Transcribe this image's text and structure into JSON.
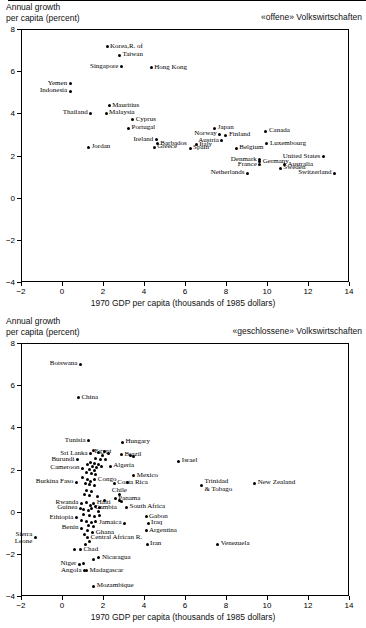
{
  "charts": [
    {
      "id": "open-economies",
      "corner_note": "«offene» Volkswirtschaften",
      "ylabel": "Annual growth\nper capita (percent)",
      "xlabel": "1970 GDP per capita (thousands of 1985 dollars)",
      "chart_data": {
        "type": "scatter",
        "title": "«offene» Volkswirtschaften",
        "xlabel": "1970 GDP per capita (thousands of 1985 dollars)",
        "ylabel": "Annual growth per capita (percent)",
        "xlim": [
          -2,
          14
        ],
        "ylim": [
          -4,
          8
        ],
        "xticks": [
          -2,
          0,
          2,
          4,
          6,
          8,
          10,
          12,
          14
        ],
        "yticks": [
          8,
          6,
          4,
          2,
          0,
          -2,
          -4
        ],
        "grid": false,
        "legend": "none",
        "points": [
          {
            "label": "Korea,R. of",
            "x": 2.15,
            "y": 7.2,
            "pos": "l"
          },
          {
            "label": "Taiwan",
            "x": 2.75,
            "y": 6.8,
            "pos": "l"
          },
          {
            "label": "Singapore",
            "x": 2.85,
            "y": 6.25,
            "pos": "r"
          },
          {
            "label": "Hong Kong",
            "x": 4.3,
            "y": 6.2,
            "pos": "l"
          },
          {
            "label": "Yemen",
            "x": 0.35,
            "y": 5.45,
            "pos": "r"
          },
          {
            "label": "Indonesia",
            "x": 0.35,
            "y": 5.1,
            "pos": "r"
          },
          {
            "label": "Mauritius",
            "x": 2.25,
            "y": 4.4,
            "pos": "l"
          },
          {
            "label": "Thailand",
            "x": 1.35,
            "y": 4.05,
            "pos": "r"
          },
          {
            "label": "Malaysia",
            "x": 2.1,
            "y": 4.05,
            "pos": "l"
          },
          {
            "label": "Cyprus",
            "x": 3.4,
            "y": 3.75,
            "pos": "l"
          },
          {
            "label": "Portugal",
            "x": 3.2,
            "y": 3.35,
            "pos": "l"
          },
          {
            "label": "Japan",
            "x": 7.4,
            "y": 3.35,
            "pos": "l"
          },
          {
            "label": "Canada",
            "x": 9.9,
            "y": 3.2,
            "pos": "l"
          },
          {
            "label": "Norway",
            "x": 7.65,
            "y": 3.05,
            "pos": "r"
          },
          {
            "label": "Finland",
            "x": 7.95,
            "y": 3.0,
            "pos": "l"
          },
          {
            "label": "Ireland",
            "x": 4.55,
            "y": 2.8,
            "pos": "r"
          },
          {
            "label": "Austria",
            "x": 7.75,
            "y": 2.75,
            "pos": "r"
          },
          {
            "label": "Luxembourg",
            "x": 9.95,
            "y": 2.6,
            "pos": "l"
          },
          {
            "label": "Barbados",
            "x": 4.6,
            "y": 2.6,
            "pos": "l"
          },
          {
            "label": "Greece",
            "x": 4.45,
            "y": 2.45,
            "pos": "l"
          },
          {
            "label": "Italy",
            "x": 6.5,
            "y": 2.55,
            "pos": "l"
          },
          {
            "label": "Jordan",
            "x": 1.25,
            "y": 2.45,
            "pos": "l"
          },
          {
            "label": "Spain",
            "x": 6.2,
            "y": 2.4,
            "pos": "l"
          },
          {
            "label": "Belgium",
            "x": 8.45,
            "y": 2.4,
            "pos": "l"
          },
          {
            "label": "United States",
            "x": 12.7,
            "y": 2.0,
            "pos": "r"
          },
          {
            "label": "Germany",
            "x": 9.6,
            "y": 1.75,
            "pos": "l"
          },
          {
            "label": "Denmark",
            "x": 9.6,
            "y": 1.85,
            "pos": "r"
          },
          {
            "label": "Australia",
            "x": 10.8,
            "y": 1.6,
            "pos": "l"
          },
          {
            "label": "France",
            "x": 9.6,
            "y": 1.6,
            "pos": "r"
          },
          {
            "label": "Sweden",
            "x": 10.6,
            "y": 1.45,
            "pos": "l"
          },
          {
            "label": "Netherlands",
            "x": 9.0,
            "y": 1.2,
            "pos": "r"
          },
          {
            "label": "Switzerland",
            "x": 13.25,
            "y": 1.2,
            "pos": "r"
          }
        ]
      }
    },
    {
      "id": "closed-economies",
      "corner_note": "«geschlossene» Volkswirtschaften",
      "ylabel": "Annual growth\nper capita (percent)",
      "xlabel": "1970 GDP per capita (thousands of 1985 dollars)",
      "chart_data": {
        "type": "scatter",
        "title": "«geschlossene» Volkswirtschaften",
        "xlabel": "1970 GDP per capita (thousands of 1985 dollars)",
        "ylabel": "Annual growth per capita (percent)",
        "xlim": [
          -2,
          14
        ],
        "ylim": [
          -4,
          8
        ],
        "xticks": [
          -2,
          0,
          2,
          4,
          6,
          8,
          10,
          12,
          14
        ],
        "yticks": [
          8,
          6,
          4,
          2,
          0,
          -2,
          -4
        ],
        "grid": false,
        "legend": "none",
        "points": [
          {
            "label": "Botswana",
            "x": 0.85,
            "y": 7.05,
            "pos": "r"
          },
          {
            "label": "China",
            "x": 0.75,
            "y": 5.45,
            "pos": "l"
          },
          {
            "label": "Tunisia",
            "x": 1.25,
            "y": 3.4,
            "pos": "r"
          },
          {
            "label": "Hungary",
            "x": 2.9,
            "y": 3.35,
            "pos": "l"
          },
          {
            "label": "Sri Lanka",
            "x": 1.35,
            "y": 2.8,
            "pos": "r"
          },
          {
            "label": "Brazil",
            "x": 2.85,
            "y": 2.75,
            "pos": "l"
          },
          {
            "label": "Egypt",
            "x": 1.95,
            "y": 2.7,
            "pos": "c"
          },
          {
            "label": "Burundi",
            "x": 0.7,
            "y": 2.5,
            "pos": "r"
          },
          {
            "label": "Israel",
            "x": 5.65,
            "y": 2.45,
            "pos": "l"
          },
          {
            "label": "Algeria",
            "x": 2.3,
            "y": 2.2,
            "pos": "l"
          },
          {
            "label": "Cameroon",
            "x": 0.95,
            "y": 2.1,
            "pos": "r"
          },
          {
            "label": "Mexico",
            "x": 3.45,
            "y": 1.75,
            "pos": "l"
          },
          {
            "label": "Congo",
            "x": 1.55,
            "y": 1.55,
            "pos": "l"
          },
          {
            "label": "Burkina Faso",
            "x": 0.65,
            "y": 1.45,
            "pos": "r"
          },
          {
            "label": "Costa Rica",
            "x": 2.5,
            "y": 1.4,
            "pos": "l"
          },
          {
            "label": "New Zealand",
            "x": 9.35,
            "y": 1.4,
            "pos": "l"
          },
          {
            "label": "Trinidad\n& Tobago",
            "x": 6.75,
            "y": 1.3,
            "pos": "l"
          },
          {
            "label": "Chile",
            "x": 2.75,
            "y": 0.85,
            "pos": "c"
          },
          {
            "label": "Panama",
            "x": 2.55,
            "y": 0.65,
            "pos": "l"
          },
          {
            "label": "Rwanda",
            "x": 0.9,
            "y": 0.45,
            "pos": "r"
          },
          {
            "label": "Haiti",
            "x": 1.5,
            "y": 0.45,
            "pos": "l"
          },
          {
            "label": "Guinea",
            "x": 0.85,
            "y": 0.2,
            "pos": "r"
          },
          {
            "label": "Gambia",
            "x": 1.4,
            "y": 0.2,
            "pos": "l"
          },
          {
            "label": "South Africa",
            "x": 3.1,
            "y": 0.25,
            "pos": "l"
          },
          {
            "label": "Ethiopia",
            "x": 0.65,
            "y": -0.25,
            "pos": "r"
          },
          {
            "label": "Gabon",
            "x": 4.05,
            "y": -0.2,
            "pos": "l"
          },
          {
            "label": "Jamaica",
            "x": 3.0,
            "y": -0.5,
            "pos": "r"
          },
          {
            "label": "Iraq",
            "x": 4.15,
            "y": -0.5,
            "pos": "l"
          },
          {
            "label": "Benin",
            "x": 0.9,
            "y": -0.75,
            "pos": "r"
          },
          {
            "label": "Argentina",
            "x": 4.05,
            "y": -0.85,
            "pos": "l"
          },
          {
            "label": "Ghana",
            "x": 1.45,
            "y": -0.95,
            "pos": "l"
          },
          {
            "label": "Central African R.",
            "x": 1.2,
            "y": -1.2,
            "pos": "l"
          },
          {
            "label": "Sierra\nLeone",
            "x": -1.35,
            "y": -1.2,
            "pos": "r"
          },
          {
            "label": "Iran",
            "x": 4.1,
            "y": -1.5,
            "pos": "l"
          },
          {
            "label": "Venezuela",
            "x": 7.55,
            "y": -1.5,
            "pos": "l"
          },
          {
            "label": "Chad",
            "x": 0.85,
            "y": -1.75,
            "pos": "l"
          },
          {
            "label": "Nicaragua",
            "x": 1.75,
            "y": -2.15,
            "pos": "l"
          },
          {
            "label": "Niger",
            "x": 0.8,
            "y": -2.45,
            "pos": "r"
          },
          {
            "label": "Angola",
            "x": 1.05,
            "y": -2.75,
            "pos": "r"
          },
          {
            "label": "Madagascar",
            "x": 1.15,
            "y": -2.75,
            "pos": "l"
          },
          {
            "label": "Mozambique",
            "x": 1.5,
            "y": -3.5,
            "pos": "l"
          }
        ],
        "unlabeled_points": [
          {
            "x": 1.5,
            "y": 2.95
          },
          {
            "x": 1.75,
            "y": 2.85
          },
          {
            "x": 2.0,
            "y": 2.9
          },
          {
            "x": 2.2,
            "y": 2.8
          },
          {
            "x": 3.3,
            "y": 2.7
          },
          {
            "x": 3.45,
            "y": 2.65
          },
          {
            "x": 1.6,
            "y": 2.55
          },
          {
            "x": 1.85,
            "y": 2.5
          },
          {
            "x": 2.05,
            "y": 2.5
          },
          {
            "x": 1.35,
            "y": 2.4
          },
          {
            "x": 1.55,
            "y": 2.35
          },
          {
            "x": 1.75,
            "y": 2.3
          },
          {
            "x": 1.2,
            "y": 2.3
          },
          {
            "x": 1.45,
            "y": 2.2
          },
          {
            "x": 1.65,
            "y": 2.15
          },
          {
            "x": 1.9,
            "y": 2.2
          },
          {
            "x": 1.3,
            "y": 2.05
          },
          {
            "x": 1.55,
            "y": 2.0
          },
          {
            "x": 1.15,
            "y": 1.9
          },
          {
            "x": 1.4,
            "y": 1.85
          },
          {
            "x": 1.6,
            "y": 1.8
          },
          {
            "x": 0.95,
            "y": 1.65
          },
          {
            "x": 1.2,
            "y": 1.55
          },
          {
            "x": 1.35,
            "y": 1.5
          },
          {
            "x": 1.1,
            "y": 1.4
          },
          {
            "x": 1.3,
            "y": 1.35
          },
          {
            "x": 1.55,
            "y": 1.3
          },
          {
            "x": 3.15,
            "y": 1.45
          },
          {
            "x": 1.15,
            "y": 1.05
          },
          {
            "x": 1.4,
            "y": 1.0
          },
          {
            "x": 1.05,
            "y": 0.85
          },
          {
            "x": 1.3,
            "y": 0.8
          },
          {
            "x": 1.7,
            "y": 0.75
          },
          {
            "x": 2.0,
            "y": 0.6
          },
          {
            "x": 2.75,
            "y": 0.6
          },
          {
            "x": 2.85,
            "y": 0.55
          },
          {
            "x": 1.15,
            "y": 0.5
          },
          {
            "x": 1.35,
            "y": 0.35
          },
          {
            "x": 1.6,
            "y": 0.3
          },
          {
            "x": 1.8,
            "y": 0.25
          },
          {
            "x": 1.0,
            "y": 0.15
          },
          {
            "x": 1.25,
            "y": 0.1
          },
          {
            "x": 1.75,
            "y": 0.05
          },
          {
            "x": 1.0,
            "y": -0.1
          },
          {
            "x": 1.3,
            "y": -0.15
          },
          {
            "x": 1.55,
            "y": -0.2
          },
          {
            "x": 1.8,
            "y": -0.15
          },
          {
            "x": 0.9,
            "y": -0.35
          },
          {
            "x": 1.15,
            "y": -0.4
          },
          {
            "x": 1.4,
            "y": -0.45
          },
          {
            "x": 1.6,
            "y": -0.4
          },
          {
            "x": 1.25,
            "y": -0.6
          },
          {
            "x": 1.5,
            "y": -0.65
          },
          {
            "x": 1.2,
            "y": -0.85
          },
          {
            "x": 1.05,
            "y": -1.05
          },
          {
            "x": 1.3,
            "y": -1.35
          },
          {
            "x": 1.1,
            "y": -1.5
          },
          {
            "x": 0.55,
            "y": -1.75
          },
          {
            "x": 1.0,
            "y": -2.4
          },
          {
            "x": 1.5,
            "y": -2.2
          }
        ]
      }
    }
  ]
}
